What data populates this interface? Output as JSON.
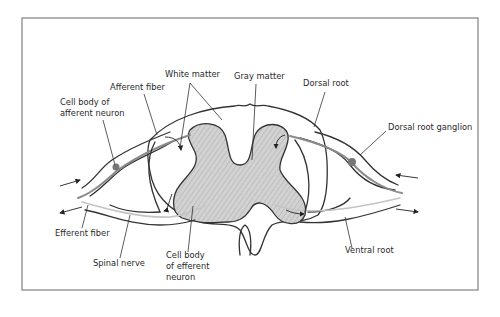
{
  "figure": {
    "colors": {
      "frame": "#555555",
      "outline": "#333333",
      "gray_matter_fill": "#c9c9c9",
      "afferent_fiber": "#8a8a8a",
      "efferent_fiber": "#c4c4c4",
      "ganglion": "#777777",
      "text": "#2a2a2a"
    },
    "labels": {
      "white_matter": "White matter",
      "gray_matter": "Gray matter",
      "dorsal_root": "Dorsal root",
      "afferent_fiber": "Afferent fiber",
      "cell_body_afferent_line1": "Cell body of",
      "cell_body_afferent_line2": "afferent neuron",
      "dorsal_root_ganglion": "Dorsal root ganglion",
      "efferent_fiber": "Efferent fiber",
      "spinal_nerve": "Spinal nerve",
      "cell_body_efferent_line1": "Cell body",
      "cell_body_efferent_line2": "of efferent",
      "cell_body_efferent_line3": "neuron",
      "ventral_root": "Ventral root"
    }
  }
}
